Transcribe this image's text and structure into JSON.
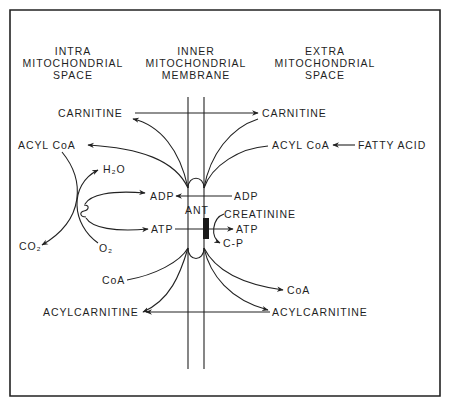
{
  "headers": {
    "intra": [
      "INTRA",
      "MITOCHONDRIAL",
      "SPACE"
    ],
    "inner": [
      "INNER",
      "MITOCHONDRIAL",
      "MEMBRANE"
    ],
    "extra": [
      "EXTRA",
      "MITOCHONDRIAL",
      "SPACE"
    ]
  },
  "labels": {
    "carnitine_left": "CARNITINE",
    "carnitine_right": "CARNITINE",
    "acyl_coa_left": "ACYL CoA",
    "acyl_coa_right": "ACYL CoA",
    "fatty_acid": "FATTY ACID",
    "h2o": "H₂O",
    "adp_left": "ADP",
    "adp_right": "ADP",
    "ant": "ANT",
    "creatinine": "CREATININE",
    "atp_left": "ATP",
    "atp_right": "ATP",
    "cp": "C-P",
    "co2": "CO₂",
    "o2": "O₂",
    "coa_left": "CoA",
    "coa_right": "CoA",
    "acylcarnitine_left": "ACYLCARNITINE",
    "acylcarnitine_right": "ACYLCARNITINE"
  },
  "colors": {
    "ink": "#1f1f1f",
    "background": "#ffffff"
  }
}
